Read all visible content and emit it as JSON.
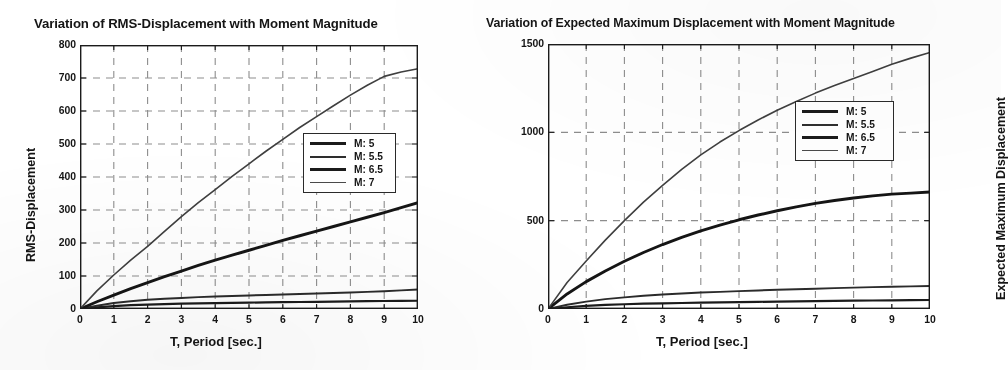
{
  "figure": {
    "axis_color": "#1b1b1b",
    "grid_color": "#8d8d8d",
    "background": "#ffffff"
  },
  "charts": [
    {
      "id": "rms-displacement",
      "title": "Variation of RMS-Displacement with Moment Magnitude",
      "xlabel": "T,  Period [sec.]",
      "ylabel": "RMS-Displacement",
      "legend_title": "",
      "legend": [
        "M: 5",
        "M: 5.5",
        "M: 6.5",
        "M: 7"
      ]
    },
    {
      "id": "expected-maximum-displacement",
      "title": "Variation of Expected Maximum Displacement with Moment Magnitude",
      "xlabel": "T,  Period [sec.]",
      "ylabel": "Expected Maximum Displacement",
      "legend_title": "",
      "legend": [
        "M: 5",
        "M: 5.5",
        "M: 6.5",
        "M: 7"
      ]
    }
  ],
  "chart_data": [
    {
      "type": "line",
      "title": "Variation of RMS-Displacement with Moment Magnitude",
      "xlabel": "T,  Period [sec.]",
      "ylabel": "RMS-Displacement",
      "xlim": [
        0,
        10
      ],
      "ylim": [
        0,
        800
      ],
      "xticks": [
        0,
        1,
        2,
        3,
        4,
        5,
        6,
        7,
        8,
        9,
        10
      ],
      "yticks": [
        0,
        100,
        200,
        300,
        400,
        500,
        600,
        700,
        800
      ],
      "grid": true,
      "grid_style": "dashed",
      "legend_position": "center-right",
      "x": [
        0,
        0.5,
        1,
        1.5,
        2,
        2.5,
        3,
        3.5,
        4,
        4.5,
        5,
        5.5,
        6,
        6.5,
        7,
        7.5,
        8,
        8.5,
        9,
        9.5,
        10
      ],
      "series": [
        {
          "name": "M: 5",
          "values": [
            0,
            5,
            9,
            11.5,
            13.5,
            15,
            16,
            17,
            18,
            18.7,
            19.4,
            20,
            20.6,
            21.2,
            21.8,
            22.4,
            23,
            23.6,
            24.2,
            24.6,
            25
          ]
        },
        {
          "name": "M: 5.5",
          "values": [
            0,
            10,
            18,
            23.5,
            28,
            31,
            33.5,
            36,
            38,
            39.6,
            41,
            42.5,
            44,
            45.5,
            47,
            48.5,
            50,
            52,
            54,
            56.5,
            59
          ]
        },
        {
          "name": "M: 6.5",
          "values": [
            0,
            22,
            42,
            62,
            80,
            98,
            115,
            132,
            148,
            163,
            178,
            193,
            208,
            222,
            236,
            250,
            264,
            278,
            292,
            307,
            322
          ]
        },
        {
          "name": "M: 7",
          "values": [
            0,
            55,
            103,
            148,
            190,
            235,
            280,
            322,
            362,
            402,
            440,
            478,
            514,
            550,
            583,
            616,
            648,
            678,
            705,
            718,
            728
          ]
        }
      ]
    },
    {
      "type": "line",
      "title": "Variation of Expected Maximum Displacement with Moment Magnitude",
      "xlabel": "T,  Period [sec.]",
      "ylabel": "Expected Maximum Displacement",
      "xlim": [
        0,
        10
      ],
      "ylim": [
        0,
        1500
      ],
      "xticks": [
        0,
        1,
        2,
        3,
        4,
        5,
        6,
        7,
        8,
        9,
        10
      ],
      "yticks": [
        0,
        500,
        1000,
        1500
      ],
      "grid": true,
      "grid_style": "dashed",
      "legend_position": "center-right",
      "x": [
        0,
        0.5,
        1,
        1.5,
        2,
        2.5,
        3,
        3.5,
        4,
        4.5,
        5,
        5.5,
        6,
        6.5,
        7,
        7.5,
        8,
        8.5,
        9,
        9.5,
        10
      ],
      "series": [
        {
          "name": "M: 5",
          "values": [
            0,
            10,
            18,
            23,
            27,
            30,
            32,
            34,
            36,
            37.5,
            39,
            40.5,
            42,
            43.5,
            45,
            46,
            47,
            48,
            49,
            50,
            51
          ]
        },
        {
          "name": "M: 5.5",
          "values": [
            0,
            24,
            42,
            56,
            66,
            75,
            82,
            88,
            93,
            97,
            101,
            105,
            109,
            112,
            115,
            118,
            121,
            124,
            126,
            128,
            130
          ]
        },
        {
          "name": "M: 6.5",
          "values": [
            0,
            85,
            155,
            215,
            270,
            320,
            365,
            405,
            442,
            475,
            505,
            532,
            556,
            578,
            598,
            614,
            628,
            640,
            650,
            656,
            662
          ]
        },
        {
          "name": "M: 7",
          "values": [
            0,
            150,
            272,
            390,
            500,
            605,
            700,
            790,
            872,
            945,
            1010,
            1070,
            1125,
            1175,
            1222,
            1265,
            1305,
            1345,
            1385,
            1420,
            1452
          ]
        }
      ]
    }
  ]
}
